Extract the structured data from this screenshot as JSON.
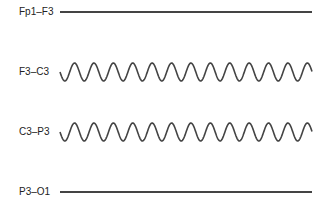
{
  "figure": {
    "title": "",
    "channels": [
      {
        "label": "Fp1–F3",
        "type": "flat",
        "y": 12
      },
      {
        "label": "F3–C3",
        "type": "sine",
        "y": 72
      },
      {
        "label": "C3–P3",
        "type": "sine",
        "y": 132
      },
      {
        "label": "P3–O1",
        "type": "flat",
        "y": 192
      }
    ],
    "trace_color": "#444444",
    "trace_x_start": 60,
    "trace_x_end": 312,
    "wave_amplitude": 9,
    "wave_period": 19.4,
    "wave_peaks_count": 13
  }
}
